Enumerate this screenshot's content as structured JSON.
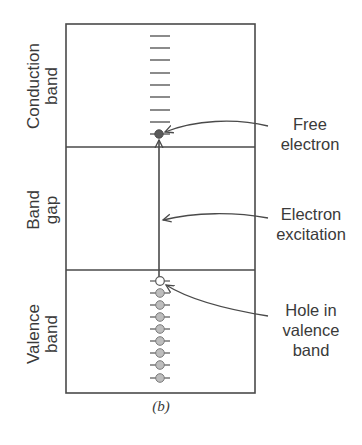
{
  "figure": {
    "caption": "(b)",
    "colors": {
      "line": "#4a4a4a",
      "level_dash": "#6e6e6e",
      "electron_fill": "#5a5a5a",
      "valence_electron_fill": "#bdbdbd",
      "hole_fill": "#ffffff",
      "text": "#3a3a3a"
    }
  },
  "bands": {
    "conduction": {
      "label_line1": "Conduction",
      "label_line2": "band"
    },
    "gap": {
      "label_line1": "Band",
      "label_line2": "gap"
    },
    "valence": {
      "label_line1": "Valence",
      "label_line2": "band"
    }
  },
  "levels": {
    "conduction_empty_count": 8,
    "conduction_occupied_count": 1,
    "valence_hole_count": 1,
    "valence_filled_count": 8
  },
  "annotations": [
    {
      "line1": "Free",
      "line2": "electron",
      "target": "electron in conduction band"
    },
    {
      "line1": "Electron",
      "line2": "excitation",
      "target": "upward arrow across band gap"
    },
    {
      "line1": "Hole in",
      "line2": "valence",
      "line3": "band",
      "target": "empty state at top of valence band"
    }
  ]
}
